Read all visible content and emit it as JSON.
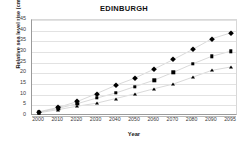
{
  "chart_data": {
    "type": "line",
    "title": "EDINBURGH",
    "xlabel": "Year",
    "ylabel": "Relative sea level rise (cm)",
    "grid": true,
    "legend": "none",
    "categories": [
      "2000",
      "2010",
      "2020",
      "2030",
      "2040",
      "2050",
      "2060",
      "2070",
      "2080",
      "2090",
      "2095"
    ],
    "x": [
      2000,
      2010,
      2020,
      2030,
      2040,
      2050,
      2060,
      2070,
      2080,
      2090,
      2095
    ],
    "xlim": [
      2000,
      2095
    ],
    "ylim": [
      0,
      45
    ],
    "yticks": [
      0,
      5,
      10,
      15,
      20,
      25,
      30,
      35,
      40,
      45
    ],
    "series": [
      {
        "name": "high",
        "marker": "diamond",
        "values": [
          2.0,
          4.0,
          6.8,
          10.5,
          14.4,
          17.8,
          22.0,
          26.5,
          31.2,
          36.2,
          39.0
        ]
      },
      {
        "name": "central",
        "marker": "square",
        "values": [
          1.8,
          3.6,
          5.8,
          8.4,
          10.8,
          13.8,
          16.8,
          20.5,
          24.4,
          28.0,
          30.4
        ]
      },
      {
        "name": "low",
        "marker": "triangle",
        "values": [
          1.5,
          3.0,
          4.6,
          6.0,
          8.2,
          10.4,
          12.8,
          15.0,
          18.2,
          21.4,
          23.0
        ]
      }
    ]
  }
}
